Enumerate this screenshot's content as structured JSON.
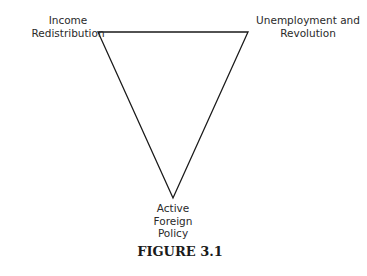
{
  "diagram": {
    "type": "triangle",
    "vertices": {
      "top_left": {
        "label_lines": [
          "Income",
          "Redistribution"
        ]
      },
      "top_right": {
        "label_lines": [
          "Unemployment and",
          "Revolution"
        ]
      },
      "bottom": {
        "label_lines": [
          "Active",
          "Foreign",
          "Policy"
        ]
      }
    },
    "caption": "FIGURE 3.1",
    "line_color": "#1a1a1a"
  }
}
